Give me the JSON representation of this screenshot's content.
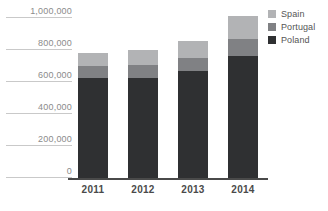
{
  "chart_data": {
    "type": "bar",
    "stacked": true,
    "title": "",
    "xlabel": "",
    "ylabel": "",
    "categories": [
      "2011",
      "2012",
      "2013",
      "2014"
    ],
    "series": [
      {
        "name": "Poland",
        "color": "#2f3032",
        "values": [
          625000,
          627000,
          668000,
          765000
        ]
      },
      {
        "name": "Portugal",
        "color": "#808184",
        "values": [
          75000,
          78000,
          85000,
          105000
        ]
      },
      {
        "name": "Spain",
        "color": "#b2b3b5",
        "values": [
          80000,
          95000,
          105000,
          140000
        ]
      }
    ],
    "totals": [
      780000,
      800000,
      858000,
      1010000
    ],
    "ylim": [
      0,
      1000000
    ],
    "yticks": [
      0,
      200000,
      400000,
      600000,
      800000,
      1000000
    ],
    "ytick_labels": [
      "0",
      "200,000",
      "400,000",
      "600,000",
      "800,000",
      "1,000,000"
    ],
    "grid": false,
    "legend_position": "right-top"
  },
  "legend": {
    "items": [
      {
        "label": "Spain"
      },
      {
        "label": "Portugal"
      },
      {
        "label": "Poland"
      }
    ]
  },
  "axis": {
    "y": {
      "labels": [
        "1,000,000",
        "800,000",
        "600,000",
        "400,000",
        "200,000",
        "0"
      ]
    },
    "x": {
      "labels": [
        "2011",
        "2012",
        "2013",
        "2014"
      ]
    }
  },
  "colors": {
    "spain": "#b2b3b5",
    "portugal": "#808184",
    "poland": "#2f3032",
    "axis_line": "#4a4a4a",
    "tick_rule": "#c9c9c9",
    "tick_text": "#8b8b8b",
    "xlabel_text": "#4a4a4a",
    "legend_text": "#555555",
    "background": "#ffffff"
  }
}
